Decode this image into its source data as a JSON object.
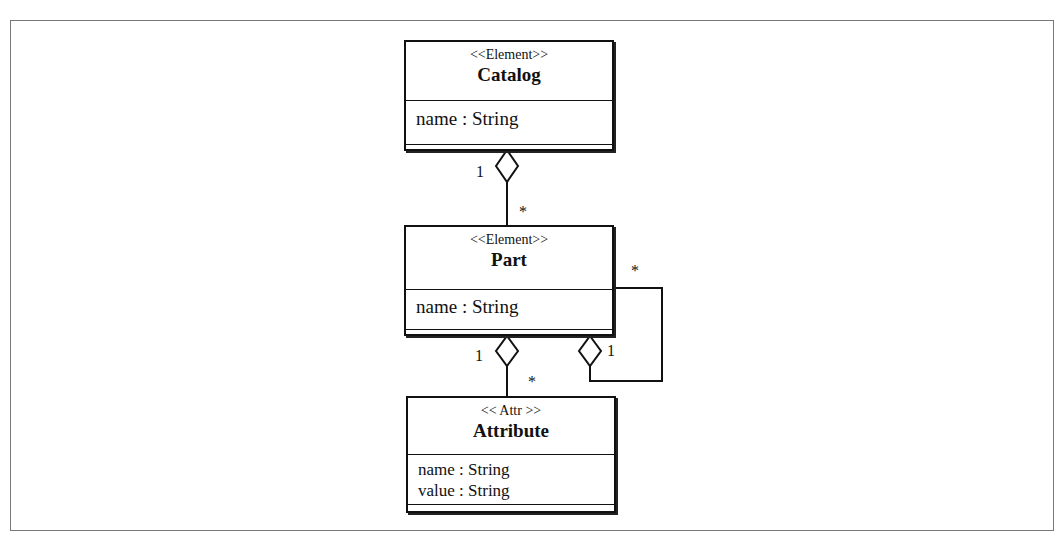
{
  "diagram": {
    "classes": [
      {
        "id": "catalog",
        "stereotype": "<<Element>>",
        "name": "Catalog",
        "attributes": [
          "name : String"
        ]
      },
      {
        "id": "part",
        "stereotype": "<<Element>>",
        "name": "Part",
        "attributes": [
          "name : String"
        ]
      },
      {
        "id": "attribute",
        "stereotype": "<< Attr >>",
        "name": "Attribute",
        "attributes": [
          "name : String",
          "value : String"
        ]
      }
    ],
    "associations": [
      {
        "from": "catalog",
        "to": "part",
        "type": "aggregation",
        "whole_multiplicity": "1",
        "part_multiplicity": "*"
      },
      {
        "from": "part",
        "to": "attribute",
        "type": "aggregation",
        "whole_multiplicity": "1",
        "part_multiplicity": "*"
      },
      {
        "from": "part",
        "to": "part",
        "type": "aggregation",
        "whole_multiplicity": "1",
        "part_multiplicity": "*"
      }
    ],
    "line_color": "#111111"
  }
}
